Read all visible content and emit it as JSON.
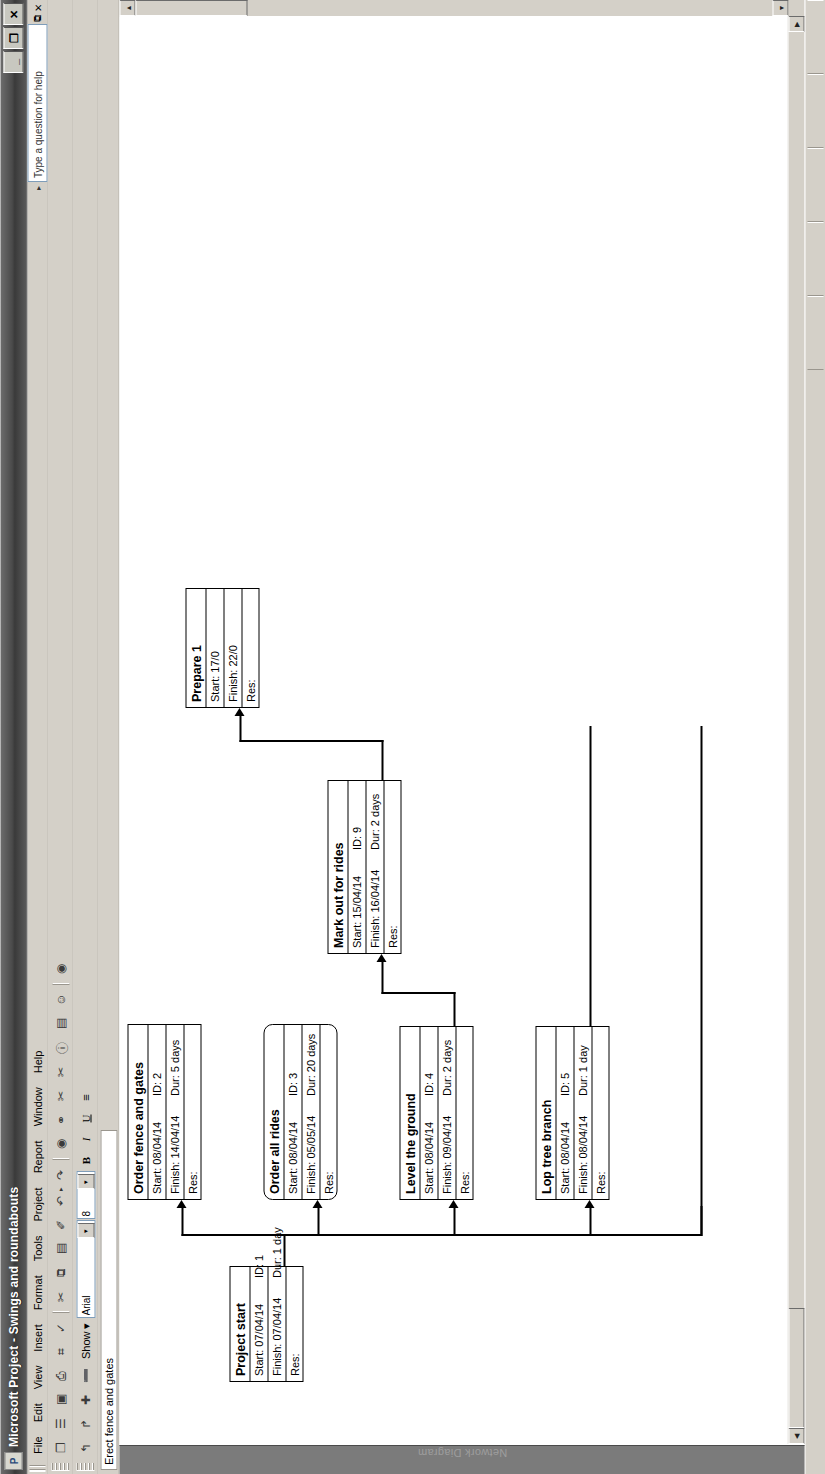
{
  "window": {
    "title": "Microsoft Project - Swings and roundabouts",
    "app_icon": "project-icon",
    "minimize_label": "_",
    "restore_label": "❐",
    "close_label": "✕"
  },
  "menu": {
    "items": [
      {
        "label": "File"
      },
      {
        "label": "Edit"
      },
      {
        "label": "View"
      },
      {
        "label": "Insert"
      },
      {
        "label": "Format"
      },
      {
        "label": "Tools"
      },
      {
        "label": "Project"
      },
      {
        "label": "Report"
      },
      {
        "label": "Window"
      },
      {
        "label": "Help"
      }
    ],
    "help_placeholder": "Type a question for help",
    "help_value": "Type a question for help"
  },
  "standard_toolbar": {
    "buttons": [
      {
        "name": "new-icon",
        "glyph": "❐"
      },
      {
        "name": "open-icon",
        "glyph": "☰"
      },
      {
        "name": "save-icon",
        "glyph": "▣"
      },
      {
        "name": "print-icon",
        "glyph": "⎙"
      },
      {
        "name": "print-preview-icon",
        "glyph": "⌗"
      },
      {
        "name": "spelling-icon",
        "glyph": "✓"
      },
      {
        "name": "cut-icon",
        "glyph": "✂"
      },
      {
        "name": "copy-icon",
        "glyph": "⧉"
      },
      {
        "name": "paste-icon",
        "glyph": "▤"
      },
      {
        "name": "format-painter-icon",
        "glyph": "✐"
      },
      {
        "name": "undo-icon",
        "glyph": "↶"
      },
      {
        "name": "redo-icon",
        "glyph": "↷"
      },
      {
        "name": "hyperlink-icon",
        "glyph": "◉"
      },
      {
        "name": "link-tasks-icon",
        "glyph": "⚭"
      },
      {
        "name": "unlink-tasks-icon",
        "glyph": "✂"
      },
      {
        "name": "split-task-icon",
        "glyph": "✂"
      },
      {
        "name": "task-information-icon",
        "glyph": "ⓘ"
      },
      {
        "name": "task-notes-icon",
        "glyph": "▤"
      },
      {
        "name": "assign-resources-icon",
        "glyph": "☺"
      },
      {
        "name": "help-icon",
        "glyph": "◉"
      }
    ]
  },
  "formatting_toolbar": {
    "outline_buttons": [
      {
        "name": "outdent-icon",
        "glyph": "↰"
      },
      {
        "name": "indent-icon",
        "glyph": "↱"
      },
      {
        "name": "show-subtasks-icon",
        "glyph": "✚"
      },
      {
        "name": "hide-subtasks-icon",
        "glyph": "➖"
      }
    ],
    "show_label": "Show",
    "show_arrow": "▾",
    "font_name": "Arial",
    "font_size": "8",
    "bold_label": "B",
    "italic_label": "I",
    "underline_label": "U",
    "align_label": "≡"
  },
  "entry_bar": {
    "value": "Erect fence and gates"
  },
  "view_bar": {
    "label": "Network Diagram"
  },
  "diagram": {
    "type": "network-diagram",
    "nodes": [
      {
        "id": "node-1",
        "title": "Project start",
        "start_label": "Start:",
        "start": "07/04/14",
        "id_label": "ID:",
        "task_id": "1",
        "finish_label": "Finish:",
        "finish": "07/04/14",
        "dur_label": "Dur:",
        "dur": "1 day",
        "res_label": "Res:",
        "res": "",
        "shape": "rect"
      },
      {
        "id": "node-2",
        "title": "Order fence and gates",
        "start_label": "Start:",
        "start": "08/04/14",
        "id_label": "ID:",
        "task_id": "2",
        "finish_label": "Finish:",
        "finish": "14/04/14",
        "dur_label": "Dur:",
        "dur": "5 days",
        "res_label": "Res:",
        "res": "",
        "shape": "rect"
      },
      {
        "id": "node-3",
        "title": "Order all rides",
        "start_label": "Start:",
        "start": "08/04/14",
        "id_label": "ID:",
        "task_id": "3",
        "finish_label": "Finish:",
        "finish": "05/05/14",
        "dur_label": "Dur:",
        "dur": "20 days",
        "res_label": "Res:",
        "res": "",
        "shape": "rounded"
      },
      {
        "id": "node-4",
        "title": "Level the ground",
        "start_label": "Start:",
        "start": "08/04/14",
        "id_label": "ID:",
        "task_id": "4",
        "finish_label": "Finish:",
        "finish": "09/04/14",
        "dur_label": "Dur:",
        "dur": "2 days",
        "res_label": "Res:",
        "res": "",
        "shape": "rect"
      },
      {
        "id": "node-5",
        "title": "Lop tree branch",
        "start_label": "Start:",
        "start": "08/04/14",
        "id_label": "ID:",
        "task_id": "5",
        "finish_label": "Finish:",
        "finish": "08/04/14",
        "dur_label": "Dur:",
        "dur": "1 day",
        "res_label": "Res:",
        "res": "",
        "shape": "rect"
      },
      {
        "id": "node-9",
        "title": "Mark out for rides",
        "start_label": "Start:",
        "start": "15/04/14",
        "id_label": "ID:",
        "task_id": "9",
        "finish_label": "Finish:",
        "finish": "16/04/14",
        "dur_label": "Dur:",
        "dur": "2 days",
        "res_label": "Res:",
        "res": "",
        "shape": "rect"
      },
      {
        "id": "node-10",
        "title": "Prepare 1",
        "start_label": "Start:",
        "start": "17/0",
        "id_label": "",
        "task_id": "",
        "finish_label": "Finish:",
        "finish": "22/0",
        "dur_label": "",
        "dur": "",
        "res_label": "Res:",
        "res": "",
        "shape": "rect"
      }
    ]
  },
  "scrollbars": {
    "up_arrow": "▲",
    "down_arrow": "▼",
    "left_arrow": "◀",
    "right_arrow": "▶"
  },
  "statusbar": {
    "mode": "",
    "cells": [
      "",
      "",
      "",
      "",
      ""
    ]
  }
}
